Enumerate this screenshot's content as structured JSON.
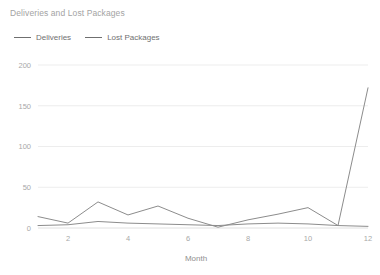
{
  "chart_data": {
    "type": "line",
    "title": "Deliveries and Lost Packages",
    "xlabel": "Month",
    "ylabel": "",
    "x": [
      1,
      2,
      3,
      4,
      5,
      6,
      7,
      8,
      9,
      10,
      11,
      12
    ],
    "xlim": [
      1,
      12
    ],
    "ylim": [
      0,
      200
    ],
    "xticks": [
      "2",
      "4",
      "6",
      "8",
      "10",
      "12"
    ],
    "xtick_values": [
      2,
      4,
      6,
      8,
      10,
      12
    ],
    "yticks": [
      "0",
      "50",
      "100",
      "150",
      "200"
    ],
    "ytick_values": [
      0,
      50,
      100,
      150,
      200
    ],
    "grid": true,
    "legend_position": "top-left",
    "series": [
      {
        "name": "Deliveries",
        "color": "#8c8c8c",
        "values": [
          14,
          6,
          32,
          16,
          27,
          12,
          1,
          10,
          17,
          25,
          3,
          172
        ]
      },
      {
        "name": "Lost Packages",
        "color": "#8c8c8c",
        "values": [
          3,
          4,
          8,
          6,
          5,
          4,
          3,
          5,
          6,
          5,
          3,
          2
        ]
      }
    ]
  },
  "legend": {
    "items": [
      {
        "label": "Deliveries"
      },
      {
        "label": "Lost Packages"
      }
    ]
  }
}
